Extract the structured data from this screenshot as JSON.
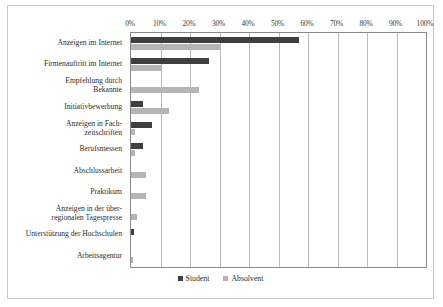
{
  "chart_data": {
    "type": "bar",
    "orientation": "horizontal",
    "title": "",
    "subtitle": "",
    "xlabel": "",
    "ylabel": "",
    "xlim": [
      0,
      100
    ],
    "xticks": [
      0,
      10,
      20,
      30,
      40,
      50,
      60,
      70,
      80,
      90,
      100
    ],
    "xtick_labels": [
      "0%",
      "10%",
      "20%",
      "30%",
      "40%",
      "50%",
      "60%",
      "70%",
      "80%",
      "90%",
      "100%"
    ],
    "grid": true,
    "legend_position": "bottom",
    "categories": [
      "Anzeigen im Internet",
      "Firmenauftritt im Internet",
      "Empfehlung durch Bekannte",
      "Initiativbewerbung",
      "Anzeigen in Fachzeitschriften",
      "Berufsmessen",
      "Abschlussarbeit",
      "Praktikum",
      "Anzeigen in der überregionalen Tagespresse",
      "Unterstützung der Hochschulen",
      "Arbeitsagentur"
    ],
    "category_lines": [
      [
        "Anzeigen im Internet"
      ],
      [
        "Firmenauftritt im Internet"
      ],
      [
        "Empfehlung durch",
        "Bekannte"
      ],
      [
        "Initiativbewerbung"
      ],
      [
        "Anzeigen in Fach-",
        "zeitschriften"
      ],
      [
        "Berufsmessen"
      ],
      [
        "Abschlussarbeit"
      ],
      [
        "Praktikum"
      ],
      [
        "Anzeigen in der über-",
        "regionalen Tagespresse"
      ],
      [
        "Unterstützung der Hochschulen"
      ],
      [
        "Arbeitsagentur"
      ]
    ],
    "series": [
      {
        "name": "Student",
        "color": "#3f3f3f",
        "values": [
          57,
          26.5,
          0,
          4,
          7,
          4,
          0,
          0,
          0,
          1,
          0
        ]
      },
      {
        "name": "Absolvent",
        "color": "#b5b5b5",
        "values": [
          30,
          10,
          23,
          13,
          1.5,
          1.5,
          5,
          5,
          2,
          0,
          0.7
        ]
      }
    ]
  },
  "legend": {
    "items": [
      {
        "label": "Student",
        "color": "#3f3f3f"
      },
      {
        "label": "Absolvent",
        "color": "#b5b5b5"
      }
    ]
  },
  "colors": {
    "student": "#3f3f3f",
    "absolvent": "#b5b5b5",
    "grid": "#b9b9b9",
    "frame": "#8a8a8a",
    "outer_border": "#c8c8c8"
  }
}
